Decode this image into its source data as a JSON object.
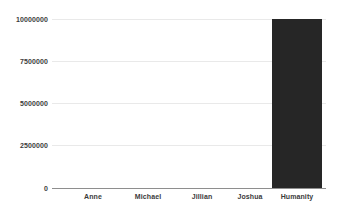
{
  "chart_data": {
    "type": "bar",
    "title": "",
    "subtitle": "",
    "xlabel": "",
    "ylabel": "",
    "categories": [
      "Anne",
      "Michael",
      "Jillian",
      "Joshua",
      "Humanity"
    ],
    "values": [
      0,
      0,
      0,
      0,
      10000000
    ],
    "ylim": [
      0,
      10000000
    ],
    "yticks": [
      0,
      2500000,
      5000000,
      7500000,
      10000000
    ],
    "ytick_labels": [
      "0",
      "2500000",
      "5000000",
      "7500000",
      "10000000"
    ],
    "grid": true,
    "legend": false,
    "legend_position": "none",
    "bar_color": "#262626",
    "gridline_color": "#e9e9e9",
    "axis_color": "#8e8e8e",
    "background_color": "#ffffff",
    "tick_label_color": "#3b3b3b"
  }
}
